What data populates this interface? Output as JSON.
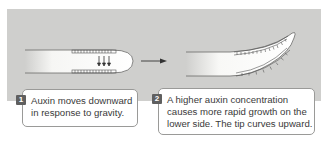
{
  "diagram": {
    "colors": {
      "panel_background": "#cfcfcd",
      "badge": "#5f5f5f",
      "callout_border": "#9a9a98",
      "text": "#3a3a3a"
    },
    "stages": [
      {
        "number": "1",
        "lines": [
          "Auxin moves downward",
          "in response to gravity."
        ]
      },
      {
        "number": "2",
        "lines": [
          "A higher auxin concentration",
          "causes more rapid growth on the",
          "lower side. The tip curves upward."
        ]
      }
    ],
    "arrow": "right-arrow"
  }
}
